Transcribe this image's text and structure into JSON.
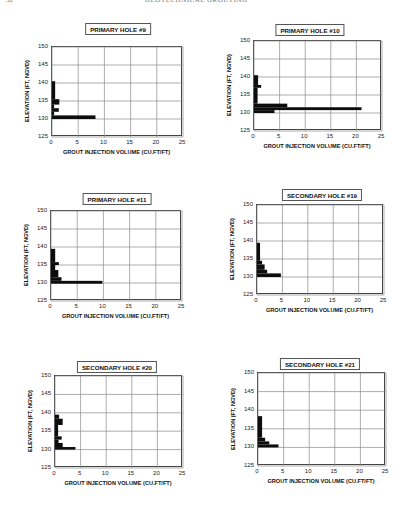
{
  "page": {
    "page_number": "32",
    "running_head": "GEOTECHNICAL GROUTING"
  },
  "chart_data": [
    {
      "type": "bar",
      "orientation": "horizontal",
      "title": "PRIMARY HOLE #9",
      "xlabel": "GROUT INJECTION VOLUME (CU.FT/FT)",
      "ylabel": "ELEVATION (FT, NGVD)",
      "xlim": [
        0,
        25
      ],
      "ylim": [
        125,
        150
      ],
      "xticks": [
        "0",
        "5",
        "10",
        "15",
        "20",
        "25"
      ],
      "yticks": [
        "150",
        "145",
        "140",
        "135",
        "130",
        "125"
      ],
      "grid": true,
      "bars": [
        {
          "y0": 130,
          "y1": 131,
          "x": 8.3
        },
        {
          "y0": 131,
          "y1": 132,
          "x": 0.4
        },
        {
          "y0": 132,
          "y1": 133,
          "x": 1.3
        },
        {
          "y0": 133,
          "y1": 134,
          "x": 0.4
        },
        {
          "y0": 134,
          "y1": 135.5,
          "x": 1.4
        },
        {
          "y0": 135.5,
          "y1": 140.5,
          "x": 0.6
        }
      ]
    },
    {
      "type": "bar",
      "orientation": "horizontal",
      "title": "PRIMARY HOLE #10",
      "xlabel": "GROUT INJECTION VOLUME (CU.FT/FT)",
      "ylabel": "ELEVATION (FT, NGVD)",
      "xlim": [
        0,
        25
      ],
      "ylim": [
        125,
        150
      ],
      "xticks": [
        "0",
        "5",
        "10",
        "15",
        "20",
        "25"
      ],
      "yticks": [
        "150",
        "145",
        "140",
        "135",
        "130",
        "125"
      ],
      "grid": true,
      "bars": [
        {
          "y0": 130,
          "y1": 130.8,
          "x": 4.0
        },
        {
          "y0": 130.8,
          "y1": 131.6,
          "x": 21.0
        },
        {
          "y0": 131.6,
          "y1": 132.6,
          "x": 6.5
        },
        {
          "y0": 132.6,
          "y1": 137,
          "x": 0.7
        },
        {
          "y0": 137,
          "y1": 137.8,
          "x": 1.4
        },
        {
          "y0": 137.8,
          "y1": 140.5,
          "x": 0.8
        }
      ]
    },
    {
      "type": "bar",
      "orientation": "horizontal",
      "title": "PRIMARY HOLE #11",
      "xlabel": "GROUT INJECTION VOLUME (CU.FT/FT)",
      "ylabel": "ELEVATION (FT, NGVD)",
      "xlim": [
        0,
        25
      ],
      "ylim": [
        125,
        150
      ],
      "xticks": [
        "0",
        "5",
        "10",
        "15",
        "20",
        "25"
      ],
      "yticks": [
        "150",
        "145",
        "140",
        "135",
        "130",
        "125"
      ],
      "grid": true,
      "bars": [
        {
          "y0": 129.8,
          "y1": 130.6,
          "x": 9.8
        },
        {
          "y0": 130.6,
          "y1": 131.6,
          "x": 2.0
        },
        {
          "y0": 131.6,
          "y1": 133.6,
          "x": 1.4
        },
        {
          "y0": 133.6,
          "y1": 135,
          "x": 0.8
        },
        {
          "y0": 135,
          "y1": 135.8,
          "x": 1.5
        },
        {
          "y0": 135.8,
          "y1": 139.5,
          "x": 0.8
        }
      ]
    },
    {
      "type": "bar",
      "orientation": "horizontal",
      "title": "SECONDARY HOLE #19",
      "xlabel": "GROUT INJECTION VOLUME (CU.FT/FT)",
      "ylabel": "ELEVATION (FT, NGVD)",
      "xlim": [
        0,
        25
      ],
      "ylim": [
        125,
        150
      ],
      "xticks": [
        "0",
        "5",
        "10",
        "15",
        "20",
        "25"
      ],
      "yticks": [
        "150",
        "145",
        "140",
        "135",
        "130",
        "125"
      ],
      "grid": true,
      "bars": [
        {
          "y0": 130,
          "y1": 131,
          "x": 4.7
        },
        {
          "y0": 131,
          "y1": 132,
          "x": 2.0
        },
        {
          "y0": 132,
          "y1": 133.5,
          "x": 1.5
        },
        {
          "y0": 133.5,
          "y1": 134.5,
          "x": 1.0
        },
        {
          "y0": 134.5,
          "y1": 139.5,
          "x": 0.6
        }
      ]
    },
    {
      "type": "bar",
      "orientation": "horizontal",
      "title": "SECONDARY HOLE #20",
      "xlabel": "GROUT INJECTION VOLUME (CU.FT/FT)",
      "ylabel": "ELEVATION (FT, NGVD)",
      "xlim": [
        0,
        25
      ],
      "ylim": [
        125,
        150
      ],
      "xticks": [
        "0",
        "5",
        "10",
        "15",
        "20",
        "25"
      ],
      "yticks": [
        "150",
        "145",
        "140",
        "135",
        "130",
        "125"
      ],
      "grid": true,
      "bars": [
        {
          "y0": 130,
          "y1": 130.7,
          "x": 4.0
        },
        {
          "y0": 130.7,
          "y1": 131.8,
          "x": 1.5
        },
        {
          "y0": 131.8,
          "y1": 132.7,
          "x": 0.7
        },
        {
          "y0": 132.7,
          "y1": 133.6,
          "x": 1.3
        },
        {
          "y0": 133.6,
          "y1": 136.7,
          "x": 0.6
        },
        {
          "y0": 136.7,
          "y1": 138.4,
          "x": 1.5
        },
        {
          "y0": 138.4,
          "y1": 139.5,
          "x": 0.8
        }
      ]
    },
    {
      "type": "bar",
      "orientation": "horizontal",
      "title": "SECONDARY HOLE #21",
      "xlabel": "GROUT INJECTION VOLUME (CU.FT/FT)",
      "ylabel": "ELEVATION (FT, NGVD)",
      "xlim": [
        0,
        25
      ],
      "ylim": [
        125,
        150
      ],
      "xticks": [
        "0",
        "5",
        "10",
        "15",
        "20",
        "25"
      ],
      "yticks": [
        "150",
        "145",
        "140",
        "135",
        "130",
        "125"
      ],
      "grid": true,
      "bars": [
        {
          "y0": 130,
          "y1": 130.8,
          "x": 4.0
        },
        {
          "y0": 130.8,
          "y1": 131.6,
          "x": 2.2
        },
        {
          "y0": 131.6,
          "y1": 132.6,
          "x": 1.4
        },
        {
          "y0": 132.6,
          "y1": 138.4,
          "x": 0.8
        }
      ]
    }
  ]
}
